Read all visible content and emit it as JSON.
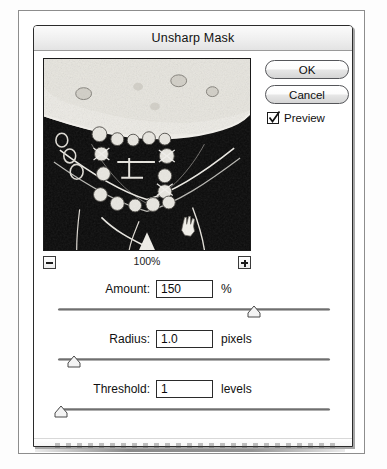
{
  "dialog": {
    "title": "Unsharp Mask",
    "buttons": {
      "ok": "OK",
      "cancel": "Cancel"
    },
    "preview_checkbox": {
      "label": "Preview",
      "checked": true
    },
    "thumbnail": {
      "zoom_level": "100%",
      "zoom_out_label": "-",
      "zoom_in_label": "+"
    },
    "parameters": [
      {
        "name": "amount",
        "label": "Amount:",
        "value": "150",
        "unit": "%",
        "slider_percent": 72
      },
      {
        "name": "radius",
        "label": "Radius:",
        "value": "1.0",
        "unit": "pixels",
        "slider_percent": 6
      },
      {
        "name": "threshold",
        "label": "Threshold:",
        "value": "1",
        "unit": "levels",
        "slider_percent": 1
      }
    ]
  },
  "colors": {
    "dialog_border": "#2b2b2b",
    "titlebar": "#ececec",
    "text": "#111111",
    "button_face": "#e6e6e6",
    "scan_frame": "#8d8d8d"
  }
}
